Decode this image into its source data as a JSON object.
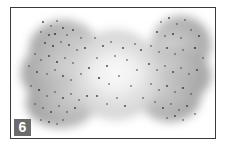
{
  "figure": {
    "label": "6",
    "colors": {
      "frame": "#3a3a3a",
      "cloud_edge": "#9a9a9a",
      "cloud_center": "#f2f2f2",
      "dots": "#3c3c3c",
      "label_bg": "#6b6b6b",
      "label_text": "#ffffff"
    }
  }
}
